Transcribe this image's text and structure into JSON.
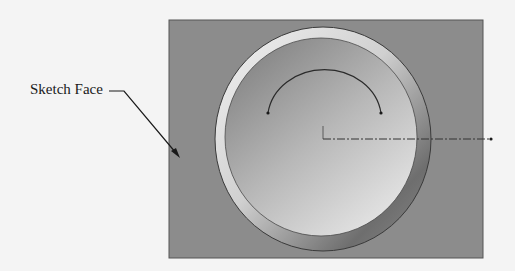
{
  "callout": {
    "label": "Sketch Face"
  },
  "colors": {
    "page_background": "#f4f4f4",
    "sketch_face": "#8c8c8c",
    "sketch_face_border": "#555555",
    "ring_light": "#e8e8e8",
    "ring_dark": "#6a6a6a",
    "inner_light": "#d8d8d8",
    "inner_dark": "#8a8a8a",
    "sketch_line": "#2a2a2a",
    "centerline": "#333333"
  },
  "geometry": {
    "face_rect": {
      "x": 169,
      "y": 20,
      "w": 314,
      "h": 238
    },
    "circle_center": {
      "x": 323,
      "y": 139
    },
    "ring_outer_radius": 111,
    "inner_radius": 97,
    "arc": {
      "start": [
        268,
        113
      ],
      "end": [
        381,
        113
      ]
    },
    "centerline": {
      "x1": 323,
      "y1": 139,
      "x2": 492,
      "y2": 139
    }
  }
}
